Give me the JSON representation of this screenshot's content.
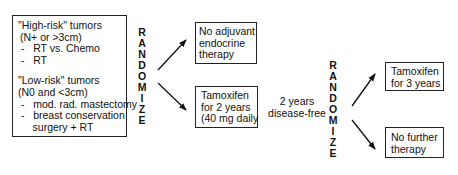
{
  "diagram": {
    "eligibility_box": {
      "lines": [
        "\"High-risk\" tumors",
        " (N+ or >3cm)",
        " -   RT vs. Chemo",
        " -   RT",
        "",
        "\"Low-risk\" tumors",
        " (N0 and <3cm)",
        " -   mod. rad. mastectomy",
        " -   breast conservation",
        "     surgery + RT"
      ]
    },
    "randomize_1": [
      "R",
      "A",
      "N",
      "D",
      "O",
      "M",
      "I",
      "Z",
      "E"
    ],
    "arm_no_adjuvant": {
      "lines": [
        "No adjuvant",
        "endocrine",
        "therapy"
      ]
    },
    "arm_tamoxifen_2y": {
      "lines": [
        "Tamoxifen",
        "for 2 years",
        "(40 mg daily"
      ]
    },
    "interval_label": {
      "lines": [
        "2 years",
        "disease-free"
      ]
    },
    "randomize_2": [
      "R",
      "A",
      "N",
      "D",
      "O",
      "M",
      "I",
      "Z",
      "E"
    ],
    "arm_tamoxifen_3y": {
      "lines": [
        "Tamoxifen",
        "for 3 years"
      ]
    },
    "arm_no_further": {
      "lines": [
        "No further",
        "therapy"
      ]
    }
  }
}
